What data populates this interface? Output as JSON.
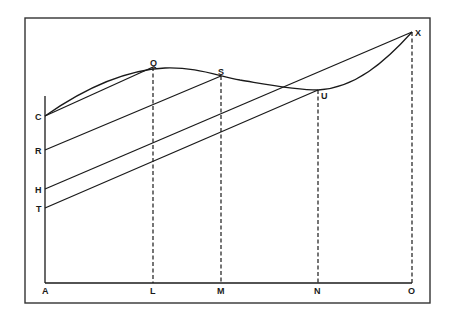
{
  "diagram": {
    "frame": {
      "x": 25,
      "y": 18,
      "w": 405,
      "h": 285
    },
    "axis_origin": {
      "x": 45,
      "y": 283
    },
    "axis_top_y": 96,
    "points": {
      "A": {
        "label": "A",
        "x": 45,
        "y": 283
      },
      "L": {
        "label": "L",
        "x": 153,
        "y": 283
      },
      "M": {
        "label": "M",
        "x": 221,
        "y": 283
      },
      "N": {
        "label": "N",
        "x": 318,
        "y": 283
      },
      "O": {
        "label": "O",
        "x": 412,
        "y": 283
      },
      "C": {
        "label": "C",
        "x": 45,
        "y": 116
      },
      "R": {
        "label": "R",
        "x": 45,
        "y": 150
      },
      "H": {
        "label": "H",
        "x": 45,
        "y": 189
      },
      "T": {
        "label": "T",
        "x": 45,
        "y": 208
      },
      "Q": {
        "label": "Q",
        "x": 153,
        "y": 67
      },
      "S": {
        "label": "S",
        "x": 221,
        "y": 76
      },
      "U": {
        "label": "U",
        "x": 318,
        "y": 90
      },
      "X": {
        "label": "X",
        "x": 412,
        "y": 32
      }
    },
    "labels": {
      "A": "A",
      "L": "L",
      "M": "M",
      "N": "N",
      "O": "O",
      "C": "C",
      "R": "R",
      "H": "H",
      "T": "T",
      "Q": "Q",
      "S": "S",
      "U": "U",
      "X": "X"
    },
    "lines": [
      {
        "from": "C",
        "to": "Q",
        "style": "solid"
      },
      {
        "from": "R",
        "to": "S",
        "style": "solid"
      },
      {
        "from": "H",
        "to": "X",
        "style": "solid"
      },
      {
        "from": "T",
        "to": "U",
        "style": "solid"
      },
      {
        "from": "Q",
        "to": "L",
        "style": "dashed"
      },
      {
        "from": "S",
        "to": "M",
        "style": "dashed"
      },
      {
        "from": "U",
        "to": "N",
        "style": "dashed"
      },
      {
        "from": "X",
        "to": "O",
        "style": "dashed"
      }
    ],
    "curve": {
      "description": "Smooth curve from C rising through Q, peaking near Q, descending through S to a minimum near U, then rising to X",
      "through": [
        "C",
        "Q",
        "S",
        "U",
        "X"
      ]
    }
  }
}
